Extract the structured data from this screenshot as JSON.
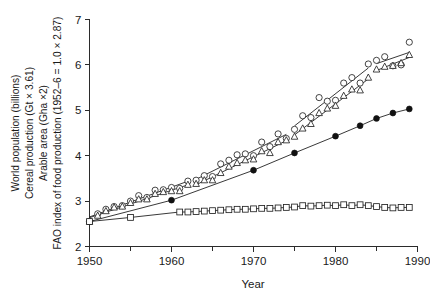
{
  "chart_data": {
    "type": "scatter",
    "title": "",
    "xlabel": "Year",
    "ylabel": "",
    "ylabel_lines": [
      "World population (billions)",
      "Cereal production (Gt × 3.61)",
      "Arable area (Gha ×2)",
      "FAO index of food production (1952–6 = 1.0 × 2.87)"
    ],
    "xlim": [
      1950,
      1990
    ],
    "ylim": [
      2,
      7
    ],
    "xticks": [
      1950,
      1960,
      1970,
      1980,
      1990
    ],
    "xticklabels": [
      "1950",
      "1960",
      "1970",
      "1980",
      "1990"
    ],
    "xticks_minor": [
      1955,
      1965,
      1975,
      1985
    ],
    "yticks": [
      2,
      3,
      4,
      5,
      6,
      7
    ],
    "yticklabels": [
      "2",
      "3",
      "4",
      "5",
      "6",
      "7"
    ],
    "grid": false,
    "legend": "none",
    "series": [
      {
        "name": "Cereal production",
        "marker": "circle-open",
        "line": "segmented",
        "x": [
          1950,
          1951,
          1952,
          1953,
          1954,
          1955,
          1956,
          1957,
          1958,
          1959,
          1960,
          1961,
          1962,
          1963,
          1964,
          1965,
          1966,
          1967,
          1968,
          1969,
          1970,
          1971,
          1972,
          1973,
          1974,
          1975,
          1976,
          1977,
          1978,
          1979,
          1980,
          1981,
          1982,
          1983,
          1984,
          1985,
          1986,
          1987,
          1988,
          1989
        ],
        "y": [
          2.55,
          2.72,
          2.82,
          2.88,
          2.9,
          3.0,
          3.12,
          3.08,
          3.24,
          3.25,
          3.3,
          3.28,
          3.44,
          3.46,
          3.56,
          3.54,
          3.82,
          3.9,
          4.02,
          4.04,
          4.0,
          4.3,
          4.2,
          4.48,
          4.38,
          4.58,
          4.88,
          4.84,
          5.28,
          5.2,
          5.22,
          5.6,
          5.72,
          5.6,
          6.02,
          6.1,
          6.18,
          5.98,
          6.0,
          6.5
        ]
      },
      {
        "name": "FAO index of food production",
        "marker": "triangle-open",
        "line": "segmented",
        "x": [
          1950,
          1951,
          1952,
          1953,
          1954,
          1955,
          1956,
          1957,
          1958,
          1959,
          1960,
          1961,
          1962,
          1963,
          1964,
          1965,
          1966,
          1967,
          1968,
          1969,
          1970,
          1971,
          1972,
          1973,
          1974,
          1975,
          1976,
          1977,
          1978,
          1979,
          1980,
          1981,
          1982,
          1983,
          1984,
          1985,
          1986,
          1987,
          1988,
          1989
        ],
        "y": [
          2.55,
          2.68,
          2.78,
          2.86,
          2.88,
          2.96,
          3.04,
          3.04,
          3.16,
          3.2,
          3.22,
          3.22,
          3.36,
          3.38,
          3.46,
          3.46,
          3.62,
          3.76,
          3.84,
          3.9,
          3.92,
          4.1,
          4.06,
          4.3,
          4.34,
          4.42,
          4.6,
          4.7,
          4.94,
          5.04,
          5.1,
          5.32,
          5.46,
          5.44,
          5.72,
          5.9,
          5.96,
          5.98,
          6.04,
          6.22
        ]
      },
      {
        "name": "World population",
        "marker": "circle-filled",
        "line": "solid",
        "x": [
          1950,
          1960,
          1970,
          1975,
          1980,
          1983,
          1985,
          1987,
          1989
        ],
        "y": [
          2.55,
          3.02,
          3.68,
          4.06,
          4.43,
          4.66,
          4.82,
          4.94,
          5.03
        ]
      },
      {
        "name": "Arable area",
        "marker": "square-open",
        "line": "solid",
        "x": [
          1950,
          1955,
          1961,
          1962,
          1963,
          1964,
          1965,
          1966,
          1967,
          1968,
          1969,
          1970,
          1971,
          1972,
          1973,
          1974,
          1975,
          1976,
          1977,
          1978,
          1979,
          1980,
          1981,
          1982,
          1983,
          1984,
          1985,
          1986,
          1987,
          1988,
          1989
        ],
        "y": [
          2.55,
          2.64,
          2.76,
          2.76,
          2.77,
          2.78,
          2.79,
          2.8,
          2.81,
          2.82,
          2.82,
          2.83,
          2.84,
          2.84,
          2.85,
          2.86,
          2.87,
          2.9,
          2.89,
          2.9,
          2.91,
          2.9,
          2.92,
          2.9,
          2.92,
          2.9,
          2.88,
          2.86,
          2.85,
          2.86,
          2.86
        ]
      }
    ]
  },
  "axis": {
    "x_title": "Year",
    "y_title_line1": "World population (billions)",
    "y_title_line2": "Cereal production (Gt × 3.61)",
    "y_title_line3": "Arable area (Gha ×2)",
    "y_title_line4": "FAO index of food production (1952–6 = 1.0 × 2.87)"
  },
  "colors": {
    "axis": "#2b2b2b",
    "marker_stroke": "#232323",
    "marker_fill": "#ffffff",
    "filled_marker": "#111111",
    "background": "#ffffff"
  }
}
